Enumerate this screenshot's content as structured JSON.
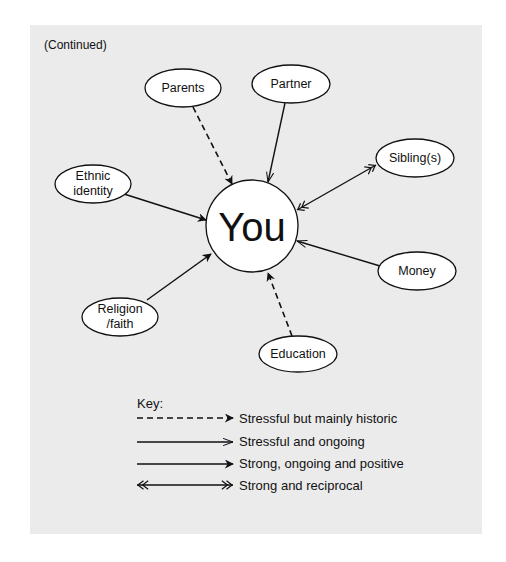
{
  "header": {
    "continued_label": "(Continued)"
  },
  "center": {
    "label": "You",
    "cx": 252,
    "cy": 226,
    "r": 46
  },
  "nodes": [
    {
      "id": "parents",
      "label": "Parents",
      "cx": 183,
      "cy": 88,
      "relationship": "stressful-historic"
    },
    {
      "id": "partner",
      "label": "Partner",
      "cx": 291,
      "cy": 84,
      "relationship": "stressful-ongoing"
    },
    {
      "id": "siblings",
      "label": "Sibling(s)",
      "cx": 415,
      "cy": 158,
      "relationship": "strong-reciprocal"
    },
    {
      "id": "ethnic-identity",
      "label": "Ethnic\nidentity",
      "line1": "Ethnic",
      "line2": "identity",
      "cx": 93,
      "cy": 184,
      "relationship": "strong-positive"
    },
    {
      "id": "money",
      "label": "Money",
      "cx": 417,
      "cy": 271,
      "relationship": "stressful-ongoing"
    },
    {
      "id": "religion-faith",
      "label": "Religion\n/faith",
      "line1": "Religion",
      "line2": "/faith",
      "cx": 120,
      "cy": 317,
      "relationship": "strong-positive"
    },
    {
      "id": "education",
      "label": "Education",
      "cx": 298,
      "cy": 354,
      "relationship": "stressful-historic"
    }
  ],
  "key": {
    "title": "Key:",
    "items": [
      {
        "style": "dashed-filled-arrow",
        "label": "Stressful but mainly historic"
      },
      {
        "style": "solid-open-arrow",
        "label": "Stressful and ongoing"
      },
      {
        "style": "solid-filled-arrow",
        "label": "Strong, ongoing and positive"
      },
      {
        "style": "double-chevron-both-ends",
        "label": "Strong and reciprocal"
      }
    ]
  },
  "colors": {
    "panel_background": "#ebebeb",
    "page_background": "#ffffff",
    "stroke": "#111111",
    "node_fill": "#ffffff"
  }
}
